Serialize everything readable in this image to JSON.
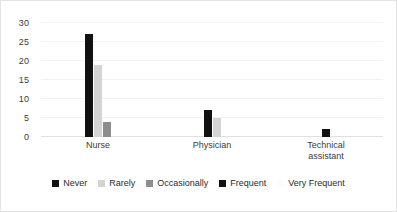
{
  "chart_data": {
    "type": "bar",
    "title": "",
    "subtitle": "",
    "xlabel": "",
    "ylabel": "",
    "categories": [
      "Nurse",
      "Physician",
      "Technical assistant"
    ],
    "category_lines": [
      [
        "Nurse"
      ],
      [
        "Physician"
      ],
      [
        "Technical",
        "assistant"
      ]
    ],
    "series": [
      {
        "name": "Never",
        "color": "#111111",
        "values": [
          27,
          7,
          0
        ]
      },
      {
        "name": "Rarely",
        "color": "#d4d4d4",
        "values": [
          19,
          5,
          0
        ]
      },
      {
        "name": "Occasionally",
        "color": "#8d8d8d",
        "values": [
          4,
          0,
          0
        ]
      },
      {
        "name": "Frequent",
        "color": "#111111",
        "values": [
          0,
          0,
          2
        ]
      },
      {
        "name": "Very Frequent",
        "color": "#fbfbfb",
        "values": [
          0,
          0,
          0
        ]
      }
    ],
    "ylim": [
      0,
      30
    ],
    "yticks": [
      0,
      5,
      10,
      15,
      20,
      25,
      30
    ],
    "ytick_labels": [
      "0",
      "5",
      "10",
      "15",
      "20",
      "25",
      "30"
    ],
    "grid": true,
    "grid_color": "#f2f2f2",
    "legend_position": "bottom",
    "background": "#ffffff",
    "border_color": "#e3e3e3"
  }
}
